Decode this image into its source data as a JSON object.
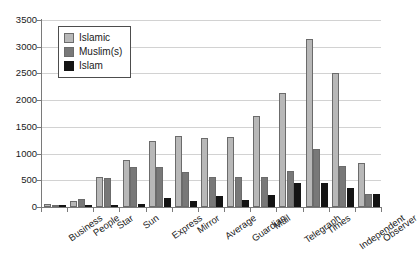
{
  "chart_data": {
    "type": "bar",
    "title": "",
    "subtitle": "",
    "xlabel": "",
    "ylabel": "",
    "ylim": [
      0,
      3500
    ],
    "ytick_interval": 500,
    "yticks": [
      0,
      500,
      1000,
      1500,
      2000,
      2500,
      3000,
      3500
    ],
    "ytick_labels": [
      "0",
      "500",
      "1000",
      "1500",
      "2000",
      "2500",
      "3000",
      "3500"
    ],
    "grid": true,
    "grid_axis": "y",
    "legend_position": "upper-left-inside",
    "orientation": "vertical",
    "categories": [
      "Business",
      "People",
      "Star",
      "Sun",
      "Express",
      "Mirror",
      "Average",
      "Guardian",
      "Mail",
      "Telegraph",
      "Times",
      "Independent",
      "Observer"
    ],
    "series": [
      {
        "name": "Islamic",
        "color": "#b8b8b8",
        "values": [
          60,
          120,
          570,
          880,
          1230,
          1330,
          1290,
          1310,
          1710,
          2140,
          3150,
          2500,
          820
        ]
      },
      {
        "name": "Muslim(s)",
        "color": "#787878",
        "values": [
          30,
          150,
          540,
          750,
          750,
          650,
          560,
          560,
          560,
          680,
          1080,
          760,
          240
        ]
      },
      {
        "name": "Islam",
        "color": "#141414",
        "values": [
          10,
          30,
          40,
          50,
          160,
          120,
          210,
          130,
          220,
          450,
          450,
          350,
          250
        ]
      }
    ]
  },
  "legend": {
    "items": [
      {
        "label": "Islamic",
        "swatch": "series-islamic"
      },
      {
        "label": "Muslim(s)",
        "swatch": "series-muslims"
      },
      {
        "label": "Islam",
        "swatch": "series-islam"
      }
    ]
  }
}
